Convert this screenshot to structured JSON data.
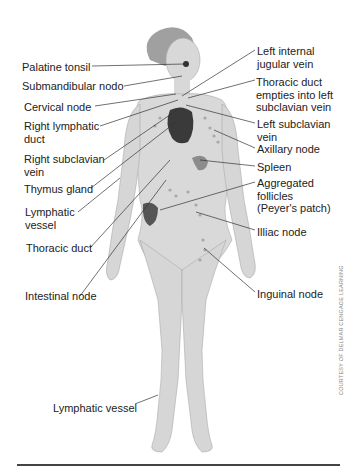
{
  "figure": {
    "credit": "COURTESY OF DELMAR CENGAGE LEARNING",
    "colors": {
      "body": "#d9d9d9",
      "outline": "#aaaaaa",
      "hair": "#9a9a9a",
      "heart": "#3a3a3a",
      "organ": "#8c8c8c",
      "nodes": "#a8a8a8",
      "leader": "#333333",
      "rule": "#444444"
    },
    "labels_left": [
      {
        "id": "palatine-tonsil",
        "text": "Palatine tonsil",
        "x": 22,
        "y": 61
      },
      {
        "id": "submandibular-node",
        "text": "Submandibular nodo",
        "x": 22,
        "y": 80
      },
      {
        "id": "cervical-node",
        "text": "Cervical node",
        "x": 24,
        "y": 101
      },
      {
        "id": "right-lymphatic-duct",
        "text": "Right lymphatic\nduct",
        "x": 24,
        "y": 120
      },
      {
        "id": "right-subclavian-vein",
        "text": "Right subclavian\nvein",
        "x": 24,
        "y": 153
      },
      {
        "id": "thymus-gland",
        "text": "Thymus gland",
        "x": 24,
        "y": 183
      },
      {
        "id": "lymphatic-vessel-arm",
        "text": "Lymphatic\nvessel",
        "x": 25,
        "y": 206
      },
      {
        "id": "thoracic-duct",
        "text": "Thoracic duct",
        "x": 26,
        "y": 242
      },
      {
        "id": "intestinal-node",
        "text": "Intestinal node",
        "x": 25,
        "y": 290
      },
      {
        "id": "lymphatic-vessel-leg",
        "text": "Lymphatic vessel",
        "x": 53,
        "y": 402
      }
    ],
    "labels_right": [
      {
        "id": "left-internal-jugular-vein",
        "text": "Left internal\njugular vein",
        "x": 257,
        "y": 45
      },
      {
        "id": "thoracic-duct-empties",
        "text": "Thoracic duct\nempties into left\nsubclavian vein",
        "x": 256,
        "y": 76
      },
      {
        "id": "left-subclavian-vein",
        "text": "Left subclavian\nvein",
        "x": 257,
        "y": 118
      },
      {
        "id": "axillary-node",
        "text": "Axillary node",
        "x": 257,
        "y": 143
      },
      {
        "id": "spleen",
        "text": "Spleen",
        "x": 257,
        "y": 161
      },
      {
        "id": "aggregated-follicles",
        "text": "Aggregated\nfollicles\n(Peyer's patch)",
        "x": 257,
        "y": 177
      },
      {
        "id": "illiac-node",
        "text": "Illiac node",
        "x": 257,
        "y": 226
      },
      {
        "id": "inguinal-node",
        "text": "Inguinal node",
        "x": 257,
        "y": 288
      }
    ]
  }
}
